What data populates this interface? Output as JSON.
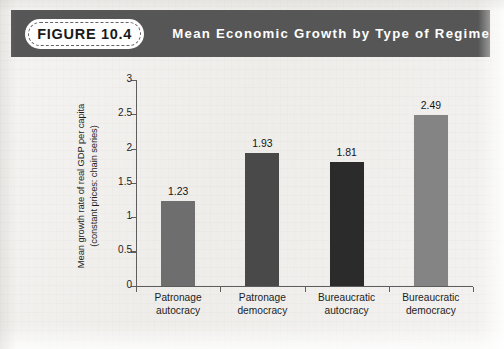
{
  "header": {
    "figure_badge": "FIGURE 10.4",
    "title": "Mean Economic Growth by Type of Regime",
    "band_color": "#565656",
    "badge_bg": "#ffffff",
    "title_color": "#ffffff"
  },
  "page": {
    "background_color": "#f2f1ef"
  },
  "chart_data": {
    "type": "bar",
    "title": "Mean Economic Growth by Type of Regime",
    "categories": [
      "Patronage autocracy",
      "Patronage democracy",
      "Bureaucratic autocracy",
      "Bureaucratic democracy"
    ],
    "category_lines": [
      [
        "Patronage",
        "autocracy"
      ],
      [
        "Patronage",
        "democracy"
      ],
      [
        "Bureaucratic",
        "autocracy"
      ],
      [
        "Bureaucratic",
        "democracy"
      ]
    ],
    "values": [
      1.23,
      1.93,
      1.81,
      2.49
    ],
    "value_labels": [
      "1.23",
      "1.93",
      "1.81",
      "2.49"
    ],
    "bar_colors": [
      "#6e6e6e",
      "#494949",
      "#2b2b2b",
      "#848484"
    ],
    "xlabel": "",
    "ylabel": "Mean growth rate of real GDP per capita (constant prices: chain series)",
    "ylabel_lines": [
      "Mean growth rate of real GDP per capita",
      "(constant prices: chain series)"
    ],
    "ylim": [
      0,
      3
    ],
    "yticks": [
      0,
      0.5,
      1,
      1.5,
      2,
      2.5,
      3
    ],
    "ytick_labels": [
      "0",
      "0.5",
      "1",
      "1.5",
      "2",
      "2.5",
      "3"
    ],
    "grid": false,
    "legend": false,
    "axis_color": "#5d5d5d"
  }
}
